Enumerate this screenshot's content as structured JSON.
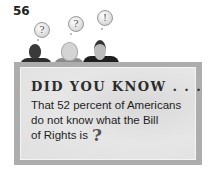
{
  "page_number": "56",
  "thought_bubbles": [
    {
      "symbol": "?",
      "icon": "question-mark-icon"
    },
    {
      "symbol": "?",
      "icon": "question-mark-icon"
    },
    {
      "symbol": "!",
      "icon": "exclamation-mark-icon"
    }
  ],
  "callout": {
    "heading": "DID YOU KNOW . . .",
    "fact_lines": [
      "That 52 percent of Americans",
      "do not know what the Bill",
      "of Rights is"
    ],
    "closing_symbol": "?"
  },
  "colors": {
    "border": "#adadad",
    "fill": "#e2e2e2",
    "text": "#1e1e1e"
  }
}
